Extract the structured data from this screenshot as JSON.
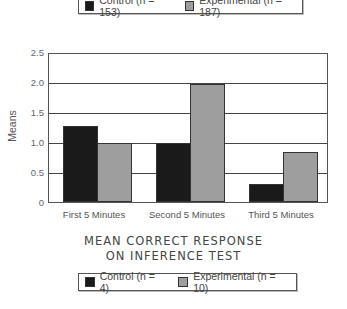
{
  "legend_top": {
    "items": [
      {
        "label": "Control (n = 153)",
        "color": "#1a1a1a"
      },
      {
        "label": "Experimental (n = 187)",
        "color": "#9e9e9e"
      }
    ]
  },
  "legend_bottom": {
    "items": [
      {
        "label": "Control (n = 4)",
        "color": "#1a1a1a"
      },
      {
        "label": "Experimental (n = 10)",
        "color": "#9e9e9e"
      }
    ]
  },
  "title_line1": "MEAN CORRECT RESPONSE",
  "title_line2": "ON INFERENCE TEST",
  "ylabel": "Means",
  "yticks": [
    "0",
    "0.5",
    "1.0",
    "1.5",
    "2.0",
    "2.5"
  ],
  "xticks": [
    "First 5 Minutes",
    "Second 5 Minutes",
    "Third 5 Minutes"
  ],
  "chart_data": {
    "type": "bar",
    "title": "Mean Correct Response on Inference Test",
    "categories": [
      "First 5 Minutes",
      "Second 5 Minutes",
      "Third 5 Minutes"
    ],
    "series": [
      {
        "name": "Control",
        "values": [
          1.28,
          1.0,
          0.3
        ],
        "color": "#1a1a1a"
      },
      {
        "name": "Experimental",
        "values": [
          1.0,
          2.0,
          0.85
        ],
        "color": "#9e9e9e"
      }
    ],
    "xlabel": "",
    "ylabel": "Means",
    "ylim": [
      0,
      2.5
    ],
    "yticks": [
      0,
      0.5,
      1.0,
      1.5,
      2.0,
      2.5
    ],
    "grid": true,
    "legends": [
      [
        "Control (n = 153)",
        "Experimental (n = 187)"
      ],
      [
        "Control (n = 4)",
        "Experimental (n = 10)"
      ]
    ]
  }
}
